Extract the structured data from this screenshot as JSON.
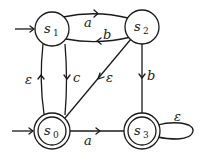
{
  "diagram": {
    "type": "finite-automaton",
    "states": [
      {
        "id": "s1",
        "name": "s",
        "sub": "1",
        "initial": true,
        "accepting": false
      },
      {
        "id": "s2",
        "name": "s",
        "sub": "2",
        "initial": false,
        "accepting": false
      },
      {
        "id": "s0",
        "name": "s",
        "sub": "0",
        "initial": true,
        "accepting": true
      },
      {
        "id": "s3",
        "name": "s",
        "sub": "3",
        "initial": false,
        "accepting": true
      }
    ],
    "transitions": [
      {
        "from": "s1",
        "to": "s2",
        "label": "a"
      },
      {
        "from": "s2",
        "to": "s1",
        "label": "b"
      },
      {
        "from": "s0",
        "to": "s1",
        "label": "ε"
      },
      {
        "from": "s1",
        "to": "s0",
        "label": "c"
      },
      {
        "from": "s2",
        "to": "s0",
        "label": "ε"
      },
      {
        "from": "s2",
        "to": "s3",
        "label": "b"
      },
      {
        "from": "s0",
        "to": "s3",
        "label": "a"
      },
      {
        "from": "s3",
        "to": "s3",
        "label": "ε"
      }
    ]
  }
}
